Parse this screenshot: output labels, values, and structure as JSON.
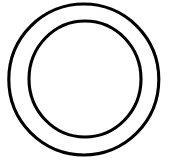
{
  "canvas": {
    "width": 170,
    "height": 166,
    "background_color": "#FFFFFF",
    "alt_description": "Black line drawing of two concentric circles forming a ring",
    "title": "Concentric Circles"
  },
  "figure": {
    "name": "concentric-circles",
    "shape_type": "annulus",
    "stroke_color": "#000000",
    "fill_color": "none",
    "shapes": [
      {
        "id": "outer-circle",
        "label": "Outer Circle",
        "cx": 83.8,
        "cy": 79.5,
        "rx": 75.0,
        "ry": 75.5,
        "stroke_width": 3.1,
        "stroke_color": "#000000",
        "fill": "none"
      },
      {
        "id": "inner-circle",
        "label": "Inner Circle",
        "cx": 85.0,
        "cy": 79.0,
        "rx": 56.0,
        "ry": 58.0,
        "stroke_width": 3.1,
        "stroke_color": "#000000",
        "fill": "none"
      }
    ]
  }
}
